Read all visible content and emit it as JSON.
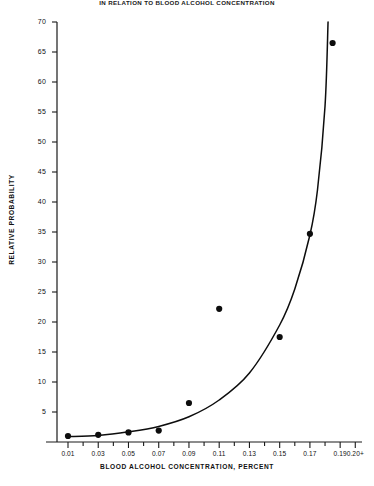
{
  "chart_data": {
    "type": "scatter",
    "title": "IN RELATION TO BLOOD ALCOHOL CONCENTRATION",
    "xlabel": "BLOOD ALCOHOL CONCENTRATION, PERCENT",
    "ylabel": "RELATIVE PROBABILITY",
    "xlim": [
      0.0,
      0.205
    ],
    "ylim": [
      0,
      70
    ],
    "grid": false,
    "legend": null,
    "yticks": [
      5,
      10,
      15,
      20,
      25,
      30,
      35,
      40,
      45,
      50,
      55,
      60,
      65,
      70
    ],
    "ytick_labels": [
      "5",
      "10",
      "15",
      "20",
      "25",
      "30",
      "35",
      "40",
      "45",
      "50",
      "55",
      "60",
      "65",
      "70"
    ],
    "xticks": [
      0.01,
      0.02,
      0.03,
      0.04,
      0.05,
      0.06,
      0.07,
      0.08,
      0.09,
      0.1,
      0.11,
      0.12,
      0.13,
      0.14,
      0.15,
      0.16,
      0.17,
      0.18,
      0.19,
      0.2
    ],
    "xtick_labels": [
      "0.01",
      "",
      "0.03",
      "",
      "0.05",
      "",
      "0.07",
      "",
      "0.09",
      "",
      "0.11",
      "",
      "0.13",
      "",
      "0.15",
      "",
      "0.17",
      "",
      "0.19",
      "0.20+"
    ],
    "series": [
      {
        "name": "Observed relative probability",
        "type": "scatter",
        "marker": "filled-circle",
        "color": "#0d0d0d",
        "x": [
          0.01,
          0.03,
          0.05,
          0.07,
          0.09,
          0.11,
          0.15,
          0.17,
          0.185
        ],
        "y": [
          1.0,
          1.2,
          1.6,
          1.9,
          6.5,
          22.2,
          17.5,
          34.7,
          66.5
        ]
      },
      {
        "name": "Fitted exponential curve",
        "type": "line",
        "color": "#0d0d0d",
        "x": [
          0.01,
          0.03,
          0.05,
          0.07,
          0.09,
          0.11,
          0.13,
          0.15,
          0.16,
          0.17,
          0.175,
          0.18,
          0.182
        ],
        "y": [
          0.9,
          1.1,
          1.7,
          2.6,
          4.2,
          7.0,
          11.5,
          19.5,
          25.5,
          34.5,
          42.0,
          56.0,
          70.0
        ]
      }
    ]
  },
  "figure": {
    "background_color": "#ffffff",
    "axis_color": "#1a1a1a"
  }
}
